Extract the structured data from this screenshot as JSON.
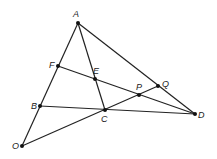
{
  "diagram": {
    "points": [
      {
        "id": "A",
        "x": 78,
        "y": 23,
        "lx": 73,
        "ly": 17
      },
      {
        "id": "F",
        "x": 58,
        "y": 66,
        "lx": 49,
        "ly": 68
      },
      {
        "id": "E",
        "x": 95,
        "y": 79,
        "lx": 93,
        "ly": 74
      },
      {
        "id": "P",
        "x": 139,
        "y": 95,
        "lx": 136,
        "ly": 90
      },
      {
        "id": "Q",
        "x": 158,
        "y": 86,
        "lx": 162,
        "ly": 87
      },
      {
        "id": "B",
        "x": 40,
        "y": 106,
        "lx": 31,
        "ly": 109
      },
      {
        "id": "C",
        "x": 105,
        "y": 110,
        "lx": 101,
        "ly": 122
      },
      {
        "id": "D",
        "x": 195,
        "y": 114,
        "lx": 198,
        "ly": 118
      },
      {
        "id": "O",
        "x": 22,
        "y": 146,
        "lx": 12,
        "ly": 149
      }
    ],
    "segments": [
      [
        "O",
        "A"
      ],
      [
        "A",
        "D"
      ],
      [
        "A",
        "C"
      ],
      [
        "F",
        "D"
      ],
      [
        "B",
        "D"
      ],
      [
        "O",
        "Q"
      ]
    ]
  }
}
